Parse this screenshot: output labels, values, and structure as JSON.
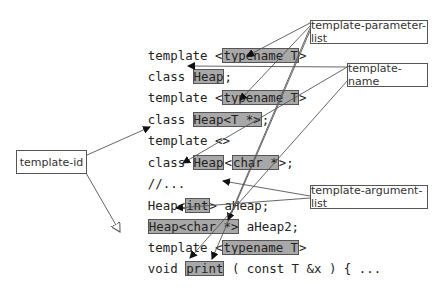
{
  "labels": {
    "template_parameter_list": "template-parameter-list",
    "template_name": "template-name",
    "template_id": "template-id",
    "template_argument_list": "template-argument-list"
  },
  "code": [
    {
      "pre": "template <",
      "hl": "typename T",
      "post": ">"
    },
    {
      "pre": "class ",
      "hl": "Heap",
      "post": ";"
    },
    {
      "pre": "template <",
      "hl": "typename T",
      "post": ">"
    },
    {
      "pre": "class ",
      "hl": "Heap<T *>",
      "post": ";"
    },
    {
      "pre": "template <>",
      "hl": "",
      "post": ""
    },
    {
      "pre": "class ",
      "hl": "Heap",
      "mid": "<",
      "hl2": "char *",
      "post": ">;"
    },
    {
      "pre": "//...",
      "hl": "",
      "post": ""
    },
    {
      "pre": "Heap<",
      "hl": "int",
      "post": "> aHeap;"
    },
    {
      "pre": "",
      "hl": "Heap<char *>",
      "post": " aHeap2;"
    },
    {
      "pre": "template <",
      "hl": "typename T",
      "post": ">"
    },
    {
      "pre": "void ",
      "hl": "print",
      "post": " ( const T &x ) { ..."
    }
  ]
}
